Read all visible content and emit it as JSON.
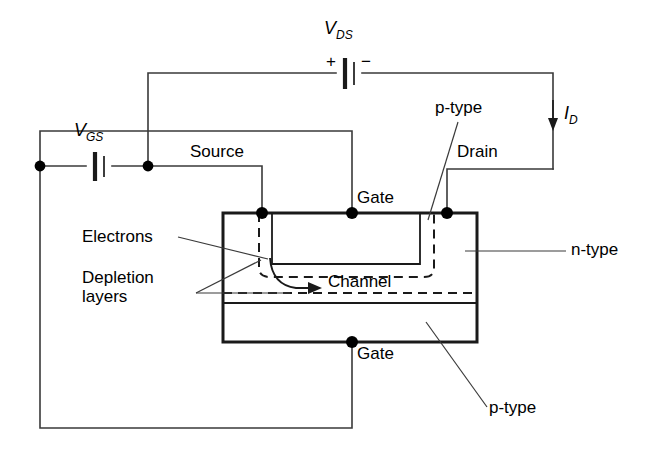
{
  "figure": {
    "type": "jfet-circuit-diagram",
    "background_color": "#ffffff",
    "line_color": "#1a1a1a",
    "thin_line_color": "#555555"
  },
  "sources": {
    "vds": {
      "symbol": "V",
      "subscript": "DS",
      "plus": "+",
      "minus": "−"
    },
    "vgs": {
      "symbol": "V",
      "subscript": "GS"
    }
  },
  "current": {
    "id": {
      "symbol": "I",
      "subscript": "D",
      "direction": "down"
    }
  },
  "terminals": {
    "source": "Source",
    "drain": "Drain",
    "gate_top": "Gate",
    "gate_bottom": "Gate"
  },
  "regions": {
    "p_type_top": "p-type",
    "p_type_bottom": "p-type",
    "n_type": "n-type",
    "channel": "Channel"
  },
  "annotations": {
    "electrons": "Electrons",
    "depletion_line1": "Depletion",
    "depletion_line2": "layers"
  }
}
